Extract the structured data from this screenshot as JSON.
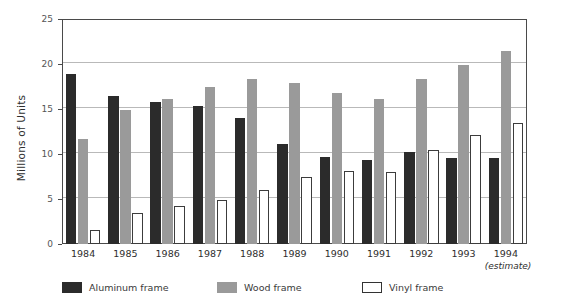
{
  "chart_data": {
    "type": "bar",
    "title": "",
    "subtitle": "",
    "xlabel": "",
    "ylabel": "Millions of Units",
    "ylim": [
      0,
      25
    ],
    "yticks": [
      0,
      5,
      10,
      15,
      20,
      25
    ],
    "ytick_labels": [
      "0",
      "5",
      "10",
      "15",
      "20",
      "25"
    ],
    "grid": "horizontal",
    "legend_position": "bottom-left",
    "categories": [
      "1984",
      "1985",
      "1986",
      "1987",
      "1988",
      "1989",
      "1990",
      "1991",
      "1992",
      "1993",
      "1994"
    ],
    "category_annotations": {
      "1994": "(estimate)"
    },
    "series": [
      {
        "name": "Aluminum frame",
        "color": "#2b2b2b",
        "values": [
          18.9,
          16.4,
          15.8,
          15.3,
          14.0,
          11.1,
          9.7,
          9.3,
          10.2,
          9.6,
          9.6
        ]
      },
      {
        "name": "Wood frame",
        "color": "#9a9a9a",
        "values": [
          11.7,
          14.9,
          16.1,
          17.4,
          18.3,
          17.9,
          16.8,
          16.1,
          18.3,
          19.9,
          21.4
        ]
      },
      {
        "name": "Vinyl frame",
        "color": "#ffffff",
        "values": [
          1.6,
          3.5,
          4.2,
          4.9,
          6.0,
          7.5,
          8.1,
          8.0,
          10.5,
          12.1,
          13.4
        ]
      }
    ]
  },
  "legend": {
    "items": [
      {
        "label": "Aluminum frame",
        "key": "aluminum"
      },
      {
        "label": "Wood frame",
        "key": "wood"
      },
      {
        "label": "Vinyl frame",
        "key": "vinyl"
      }
    ]
  },
  "colors": {
    "aluminum": "#2b2b2b",
    "wood": "#9a9a9a",
    "vinyl": "#ffffff",
    "axis": "#4a4a4a",
    "grid": "#b9b9b9",
    "text": "#2e2e2e"
  }
}
